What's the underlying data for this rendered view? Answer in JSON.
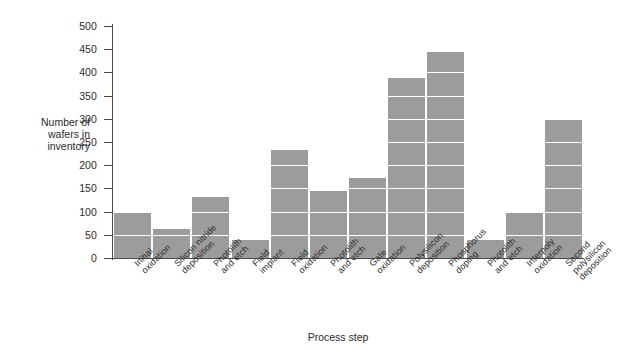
{
  "chart_data": {
    "type": "bar",
    "title": "",
    "xlabel": "Process step",
    "ylabel": "Number of\nwafers in\ninventory",
    "ylim": [
      0,
      500
    ],
    "ytick_step": 50,
    "yticks": [
      0,
      50,
      100,
      150,
      200,
      250,
      300,
      350,
      400,
      450,
      500
    ],
    "grid": "horizontal-white-on-bars",
    "legend": "none",
    "bar_color": "#9c9c9c",
    "gridline_color": "#ffffff",
    "axis_color": "#4a4a4a",
    "categories": [
      "Initial\noxidation",
      "Silicon nitride\ndeposition",
      "Photolith\nand etch",
      "Field\nimplant",
      "Field\noxidation",
      "Photolith\nand etch",
      "Gate\noxidation",
      "Polysilicon\ndeposition",
      "Phosphorus\ndoping",
      "Photolith\nand etch",
      "Interpoly\noxidation",
      "Second\npolysilicon\ndeposition"
    ],
    "values": [
      97,
      62,
      132,
      38,
      232,
      145,
      172,
      388,
      443,
      38,
      97,
      300
    ]
  }
}
